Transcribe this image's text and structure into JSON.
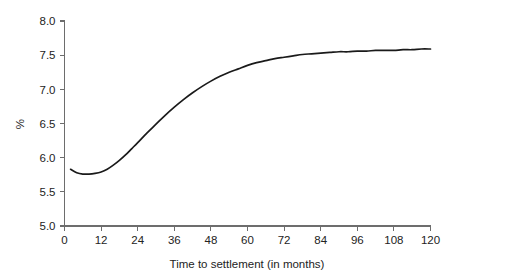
{
  "chart_data": {
    "type": "line",
    "title": "",
    "xlabel": "Time to settlement (in months)",
    "ylabel": "%",
    "xlim": [
      0,
      120
    ],
    "ylim": [
      5.0,
      8.0
    ],
    "xticks": [
      0,
      12,
      24,
      36,
      48,
      60,
      72,
      84,
      96,
      108,
      120
    ],
    "xtick_labels": [
      "0",
      "12",
      "24",
      "36",
      "48",
      "60",
      "72",
      "84",
      "96",
      "108",
      "120"
    ],
    "yticks": [
      5.0,
      5.5,
      6.0,
      6.5,
      7.0,
      7.5,
      8.0
    ],
    "ytick_labels": [
      "5.0",
      "5.5",
      "6.0",
      "6.5",
      "7.0",
      "7.5",
      "8.0"
    ],
    "grid": false,
    "legend": null,
    "series": [
      {
        "name": "Yield curve",
        "color": "#1a1a1a",
        "x": [
          2,
          4,
          6,
          8,
          10,
          12,
          14,
          16,
          18,
          20,
          22,
          24,
          27,
          30,
          33,
          36,
          39,
          42,
          45,
          48,
          51,
          54,
          57,
          60,
          63,
          66,
          69,
          72,
          75,
          78,
          81,
          84,
          87,
          90,
          93,
          96,
          99,
          102,
          105,
          108,
          111,
          114,
          117,
          120
        ],
        "y": [
          5.83,
          5.78,
          5.76,
          5.76,
          5.77,
          5.79,
          5.83,
          5.89,
          5.96,
          6.04,
          6.13,
          6.22,
          6.36,
          6.49,
          6.62,
          6.74,
          6.85,
          6.95,
          7.04,
          7.12,
          7.19,
          7.25,
          7.3,
          7.35,
          7.39,
          7.42,
          7.45,
          7.47,
          7.49,
          7.51,
          7.52,
          7.53,
          7.54,
          7.55,
          7.55,
          7.56,
          7.56,
          7.57,
          7.57,
          7.57,
          7.58,
          7.58,
          7.59,
          7.59
        ]
      }
    ]
  },
  "plot": {
    "axis_color": "#6d6d6d",
    "curve_color": "#1a1a1a",
    "background": "#ffffff"
  }
}
